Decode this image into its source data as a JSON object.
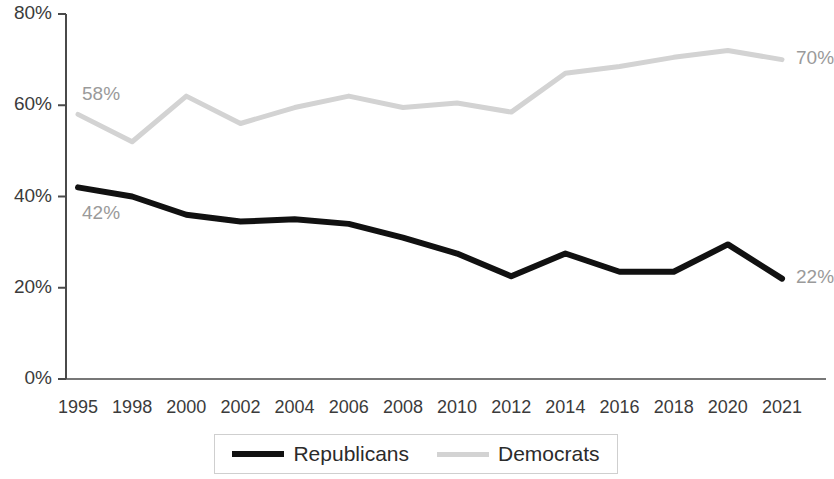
{
  "chart_data": {
    "type": "line",
    "title": "",
    "subtitle": "",
    "xlabel": "",
    "ylabel": "",
    "ylim": [
      0,
      80
    ],
    "ytick_labels": [
      "0%",
      "20%",
      "40%",
      "60%",
      "80%"
    ],
    "ytick_values": [
      0,
      20,
      40,
      60,
      80
    ],
    "grid": false,
    "legend_position": "bottom",
    "categories": [
      "1995",
      "1998",
      "2000",
      "2002",
      "2004",
      "2006",
      "2008",
      "2010",
      "2012",
      "2014",
      "2016",
      "2018",
      "2020",
      "2021"
    ],
    "series": [
      {
        "name": "Republicans",
        "color": "#111111",
        "values": [
          42,
          40,
          36,
          34.5,
          35,
          34,
          31,
          27.5,
          22.5,
          27.5,
          23.5,
          23.5,
          29.5,
          22
        ]
      },
      {
        "name": "Democrats",
        "color": "#d3d3d3",
        "values": [
          58,
          52,
          62,
          56,
          59.5,
          62,
          59.5,
          60.5,
          58.5,
          67,
          68.5,
          70.5,
          72,
          70
        ]
      }
    ],
    "annotations": [
      {
        "text": "58%",
        "series": "Democrats",
        "category": "1995",
        "position": "above-left"
      },
      {
        "text": "42%",
        "series": "Republicans",
        "category": "1995",
        "position": "below-left"
      },
      {
        "text": "70%",
        "series": "Democrats",
        "category": "2021",
        "position": "right"
      },
      {
        "text": "22%",
        "series": "Republicans",
        "category": "2021",
        "position": "right"
      }
    ]
  },
  "legend": {
    "items": [
      {
        "label": "Republicans",
        "marker": "solid-thick-black-line"
      },
      {
        "label": "Democrats",
        "marker": "solid-light-gray-line"
      }
    ]
  },
  "axes": {
    "y_labels": [
      "80%",
      "60%",
      "40%",
      "20%",
      "0%"
    ],
    "x_labels": [
      "1995",
      "1998",
      "2000",
      "2002",
      "2004",
      "2006",
      "2008",
      "2010",
      "2012",
      "2014",
      "2016",
      "2018",
      "2020",
      "2021"
    ]
  }
}
